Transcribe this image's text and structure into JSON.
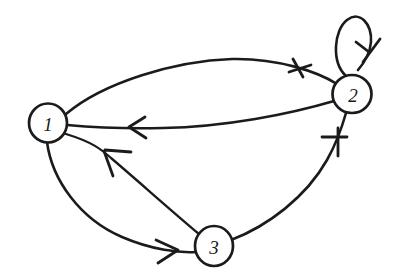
{
  "figure": {
    "type": "directed-graph",
    "title": "",
    "background_color": "#ffffff",
    "ink_color": "#1b1b1b",
    "width": 393,
    "height": 280,
    "style": "hand-drawn"
  },
  "nodes": [
    {
      "id": "1",
      "label": "1",
      "cx": 48,
      "cy": 123,
      "r": 19
    },
    {
      "id": "2",
      "label": "2",
      "cx": 352,
      "cy": 94,
      "r": 19
    },
    {
      "id": "3",
      "label": "3",
      "cx": 214,
      "cy": 246,
      "r": 19
    }
  ],
  "edges": [
    {
      "id": "e1",
      "from": "1",
      "to": "2",
      "name": "edge-1-to-2-upper-arc",
      "curve": "arc-above",
      "arrow_at": [
        300,
        68
      ]
    },
    {
      "id": "e2",
      "from": "2",
      "to": "1",
      "name": "edge-2-to-1-lower-arc",
      "curve": "arc-shallow",
      "arrow_at": [
        133,
        126
      ]
    },
    {
      "id": "e3",
      "from": "3",
      "to": "1",
      "name": "edge-3-to-1",
      "curve": "arc-shallow",
      "arrow_at": [
        108,
        153
      ]
    },
    {
      "id": "e4",
      "from": "1",
      "to": "3",
      "name": "edge-1-to-3",
      "curve": "arc-below",
      "arrow_at": [
        172,
        251
      ]
    },
    {
      "id": "e5",
      "from": "3",
      "to": "2",
      "name": "edge-3-to-2",
      "curve": "arc-right",
      "arrow_at": [
        334,
        144
      ]
    },
    {
      "id": "e6",
      "from": "2",
      "to": "2",
      "name": "self-loop-node-2",
      "curve": "loop-above",
      "arrow_at": [
        367,
        48
      ]
    }
  ]
}
